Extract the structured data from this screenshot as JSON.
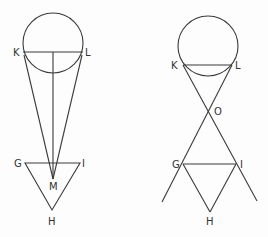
{
  "figures": [
    {
      "name": "left",
      "labels": {
        "K": "K",
        "L": "L",
        "G": "G",
        "I": "I",
        "M": "M",
        "H": "H"
      }
    },
    {
      "name": "right",
      "labels": {
        "K": "K",
        "L": "L",
        "O": "O",
        "G": "G",
        "I": "I",
        "H": "H"
      }
    }
  ],
  "colors": {
    "stroke": "#3a3a3a",
    "label": "#333333"
  }
}
